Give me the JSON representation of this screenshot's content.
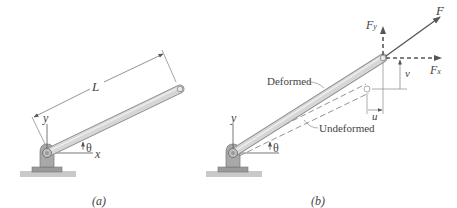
{
  "figure": {
    "panels": [
      {
        "id": "a",
        "caption": "(a)",
        "labels": {
          "length": "L",
          "y_axis": "y",
          "x_axis": "x",
          "angle": "θ"
        }
      },
      {
        "id": "b",
        "caption": "(b)",
        "labels": {
          "y_axis": "y",
          "angle": "θ",
          "deformed": "Deformed",
          "undeformed": "Undeformed",
          "force": "F",
          "force_y": "F",
          "force_y_sub": "y",
          "force_x": "F",
          "force_x_sub": "x",
          "disp_u": "u",
          "disp_v": "v"
        }
      }
    ],
    "colors": {
      "bar_fill": "#d4d4d4",
      "bar_edge": "#8a8a8a",
      "line": "#555555",
      "ground": "#c8c8c8",
      "arrow": "#555555"
    }
  }
}
